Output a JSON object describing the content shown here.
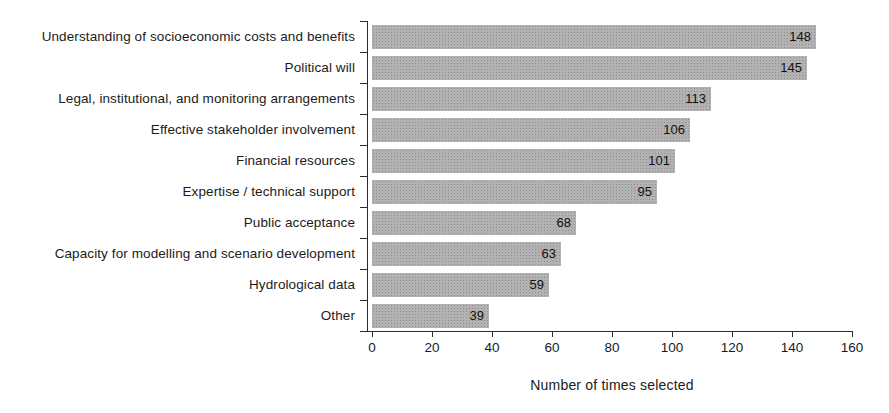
{
  "chart_data": {
    "type": "bar",
    "orientation": "horizontal",
    "title": "",
    "xlabel": "Number of times selected",
    "ylabel": "",
    "categories": [
      "Understanding of socioeconomic costs and benefits",
      "Political will",
      "Legal, institutional, and monitoring arrangements",
      "Effective stakeholder involvement",
      "Financial resources",
      "Expertise / technical support",
      "Public acceptance",
      "Capacity for modelling and scenario development",
      "Hydrological data",
      "Other"
    ],
    "values": [
      148,
      145,
      113,
      106,
      101,
      95,
      68,
      63,
      59,
      39
    ],
    "value_labels_shown": true,
    "xlim": [
      0,
      160
    ],
    "xticks": [
      0,
      20,
      40,
      60,
      80,
      100,
      120,
      140,
      160
    ],
    "grid": false,
    "legend": "none",
    "bar_color": "#b2b2b2",
    "bar_texture": "halftone-dots",
    "axis_color": "#2b2b2b",
    "text_color": "#1b1b1b"
  }
}
